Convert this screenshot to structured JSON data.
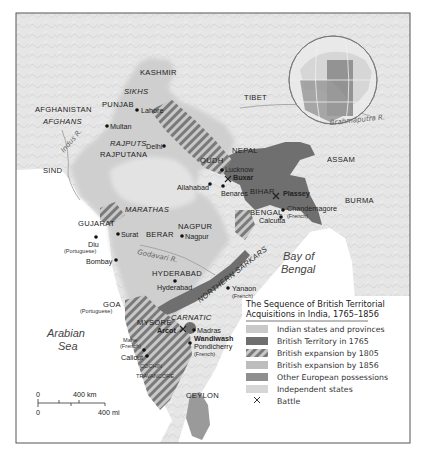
{
  "map": {
    "title": "The Sequence of British Territorial Acquisitions in India, 1765–1856",
    "title_line1": "The Sequence of British Territorial",
    "title_line2": "Acquisitions in India, 1765–1856",
    "legend": [
      {
        "label": "Indian states and provinces",
        "color": "#c9c9c9",
        "pattern": "solid"
      },
      {
        "label": "British Territory in 1765",
        "color": "#6e6e6e",
        "pattern": "solid"
      },
      {
        "label": "British expansion by 1805",
        "color": "#8a8a8a",
        "pattern": "hatched"
      },
      {
        "label": "British expansion  by 1856",
        "color": "#bdbdbd",
        "pattern": "solid"
      },
      {
        "label": "Other European possessions",
        "color": "#8f8f8f",
        "pattern": "solid"
      },
      {
        "label": "Independent states",
        "color": "#d6d6d6",
        "pattern": "solid"
      },
      {
        "label": "Battle",
        "symbol": "×"
      }
    ],
    "regions": {
      "kashmir": "KASHMIR",
      "sikhs": "SIKHS",
      "punjab": "PUNJAB",
      "afghanistan": "AFGHANISTAN",
      "afghans": "AFGHANS",
      "rajputs": "RAJPUTS",
      "rajputana": "RAJPUTANA",
      "sind": "SIND",
      "tibet": "TIBET",
      "nepal": "NEPAL",
      "oudh": "OUDH",
      "assam": "ASSAM",
      "bihar": "BIHAR",
      "bengal": "BENGAL",
      "burma": "BURMA",
      "marathas": "MARATHAS",
      "gujarat": "GUJARAT",
      "nagpur": "NAGPUR",
      "berar": "BERAR",
      "hyderabad": "HYDERABAD",
      "northern_sarkars": "NORTHERN SARKARS",
      "carnatic": "CARNATIC",
      "mysore": "MYSORE",
      "goa": "GOA",
      "cochin": "COCHIN",
      "travancore": "TRAVANCORE",
      "ceylon": "CEYLON"
    },
    "cities": {
      "lahore": "Lahore",
      "multan": "Multan",
      "delhi": "Delhi",
      "lucknow": "Lucknow",
      "buxar": "Buxar",
      "allahabad": "Allahabad",
      "benares": "Benares",
      "plassey": "Plassey",
      "chandernagore": "Chandernagore",
      "calcutta": "Calcutta",
      "surat": "Surat",
      "nagpur": "Nagpur",
      "diu": "Diu",
      "bombay": "Bombay",
      "hyderabad": "Hyderabad",
      "yanaon": "Yanaon",
      "arcot": "Arcot",
      "madras": "Madras",
      "wandiwash": "Wandiwash",
      "pondicherry": "Pondicherry",
      "mahe": "Mahe",
      "calicut": "Calicut"
    },
    "notes": {
      "portuguese": "(Portuguese)",
      "french": "(French)"
    },
    "rivers": {
      "indus": "Indus R.",
      "brahmaputra": "Brahmaputra R.",
      "godavari": "Godavari R."
    },
    "seas": {
      "arabian1": "Arabian",
      "arabian2": "Sea",
      "bay1": "Bay of",
      "bay2": "Bengal"
    },
    "scale": {
      "km_zero": "0",
      "km_label": "400 km",
      "mi_zero": "0",
      "mi_label": "400 mi"
    }
  }
}
